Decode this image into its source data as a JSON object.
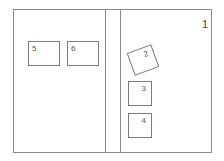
{
  "diagram": {
    "page_number": "1",
    "boxes": [
      {
        "id": "2",
        "label": "2"
      },
      {
        "id": "3",
        "label": "3"
      },
      {
        "id": "4",
        "label": "4"
      },
      {
        "id": "5",
        "label": "5"
      },
      {
        "id": "6",
        "label": "6"
      }
    ]
  }
}
